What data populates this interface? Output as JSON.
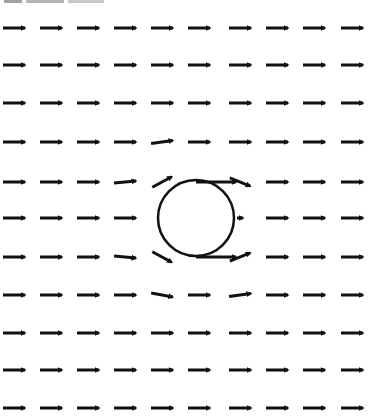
{
  "diagram": {
    "type": "vector-field",
    "cutoff_text": "",
    "colors": {
      "arrow": "#111111",
      "background": "#ffffff",
      "circle": "#111111"
    },
    "grid": {
      "columns_x": [
        14,
        51,
        88,
        125,
        162,
        199,
        240,
        277,
        314,
        352
      ],
      "rows_y": [
        28,
        65,
        103,
        142,
        182,
        218,
        257,
        295,
        333,
        370,
        408
      ],
      "arrow_length": 22
    },
    "circle": {
      "cx": 196,
      "cy": 218,
      "r": 38
    },
    "special_arrows": [
      {
        "row": 4,
        "col": 4,
        "angle": -28
      },
      {
        "row": 4,
        "col": 5,
        "angle": 0,
        "length": 40,
        "x0": 196
      },
      {
        "row": 4,
        "col": 6,
        "angle": 22
      },
      {
        "row": 5,
        "col": 4,
        "skip": true
      },
      {
        "row": 5,
        "col": 5,
        "skip": true
      },
      {
        "row": 5,
        "col": 6,
        "angle": 0,
        "length": 6
      },
      {
        "row": 6,
        "col": 4,
        "angle": 28
      },
      {
        "row": 6,
        "col": 5,
        "angle": 0,
        "length": 40,
        "x0": 196
      },
      {
        "row": 6,
        "col": 6,
        "angle": -22
      },
      {
        "row": 3,
        "col": 4,
        "angle": -8
      },
      {
        "row": 7,
        "col": 4,
        "angle": 10
      },
      {
        "row": 7,
        "col": 6,
        "angle": -8
      },
      {
        "row": 4,
        "col": 3,
        "angle": -5
      },
      {
        "row": 6,
        "col": 3,
        "angle": 6
      }
    ]
  }
}
